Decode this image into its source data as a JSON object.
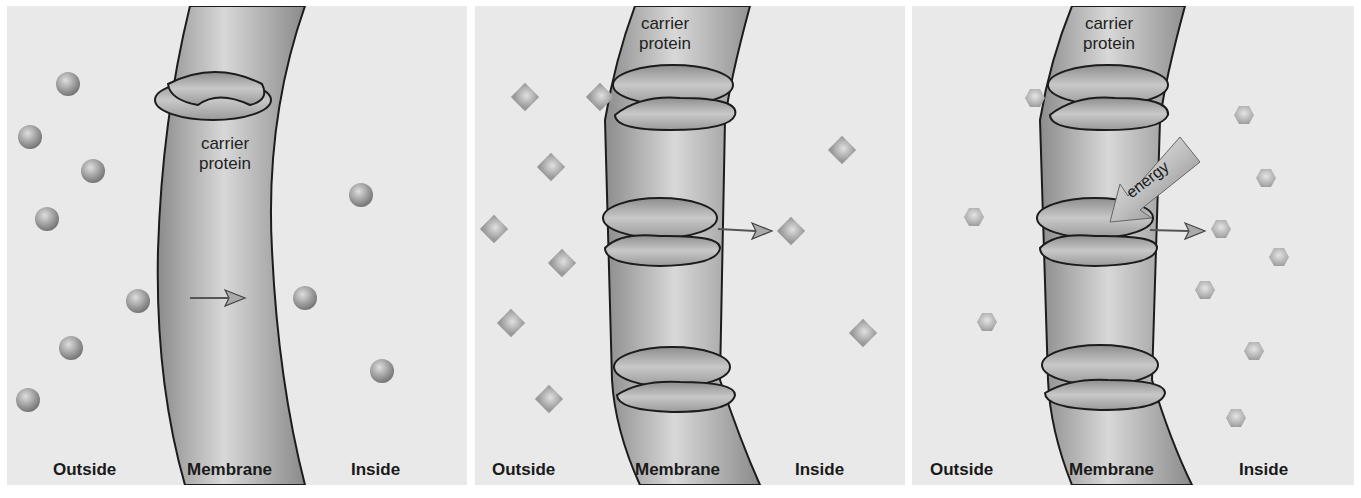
{
  "panels": [
    {
      "id": "panel-1",
      "title_label": "carrier protein",
      "carrier_line1": "carrier",
      "carrier_line2": "protein",
      "labels": {
        "outside": "Outside",
        "membrane": "Membrane",
        "inside": "Inside"
      },
      "molecule_shape": "sphere",
      "molecules": [
        [
          68,
          84
        ],
        [
          30,
          137
        ],
        [
          93,
          171
        ],
        [
          47,
          219
        ],
        [
          138,
          301
        ],
        [
          71,
          348
        ],
        [
          28,
          400
        ],
        [
          361,
          195
        ],
        [
          305,
          298
        ],
        [
          382,
          371
        ]
      ],
      "arrow": {
        "x1": 190,
        "y1": 298,
        "x2": 245,
        "y2": 298
      }
    },
    {
      "id": "panel-2",
      "carrier_line1": "carrier",
      "carrier_line2": "protein",
      "labels": {
        "outside": "Outside",
        "membrane": "Membrane",
        "inside": "Inside"
      },
      "molecule_shape": "diamond",
      "molecules": [
        [
          525,
          97
        ],
        [
          600,
          97
        ],
        [
          551,
          167
        ],
        [
          494,
          229
        ],
        [
          562,
          263
        ],
        [
          511,
          323
        ],
        [
          549,
          399
        ],
        [
          842,
          150
        ],
        [
          791,
          231
        ],
        [
          863,
          333
        ]
      ],
      "arrow": {
        "x1": 718,
        "y1": 229,
        "x2": 770,
        "y2": 231
      }
    },
    {
      "id": "panel-3",
      "carrier_line1": "carrier",
      "carrier_line2": "protein",
      "energy_label": "energy",
      "labels": {
        "outside": "Outside",
        "membrane": "Membrane",
        "inside": "Inside"
      },
      "molecule_shape": "hexagon",
      "molecules": [
        [
          1035,
          98
        ],
        [
          1244,
          115
        ],
        [
          1266,
          178
        ],
        [
          974,
          217
        ],
        [
          1221,
          229
        ],
        [
          1279,
          257
        ],
        [
          1205,
          290
        ],
        [
          987,
          322
        ],
        [
          1254,
          351
        ],
        [
          1236,
          418
        ]
      ],
      "arrow": {
        "x1": 1150,
        "y1": 230,
        "x2": 1205,
        "y2": 231
      }
    }
  ],
  "colors": {
    "background": "#e9e9e9",
    "membrane_light": "#d6d6d6",
    "membrane_dark": "#8e8e8e",
    "outline": "#1c1c1c",
    "molecule": "#a0a0a0"
  }
}
